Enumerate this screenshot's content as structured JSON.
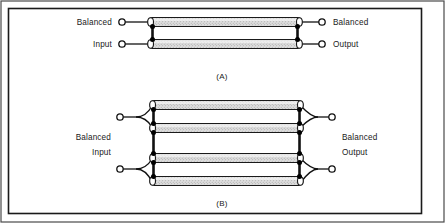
{
  "figure": {
    "background_color": "#ffffff",
    "line_color": "#111111",
    "cable_fill_color": "#d8d8d8",
    "cable_edge_color": "#1a1a1a",
    "terminal_color": "#ffffff",
    "node_color": "#000000",
    "border": {
      "outer_color": "#2b2b2b",
      "inner_color": "#1a1a1a"
    },
    "panels": [
      {
        "id": "A",
        "caption": "(A)",
        "cable_count": 2,
        "input_label_line1": "Balanced",
        "input_label_line2": "Input",
        "output_label_line1": "Balanced",
        "output_label_line2": "Output",
        "junction_style": "direct",
        "cables": [
          {
            "y": 22,
            "x1": 148,
            "x2": 302
          },
          {
            "y": 44,
            "x1": 148,
            "x2": 302
          }
        ],
        "input_terminals": [
          {
            "x": 122,
            "y": 22
          },
          {
            "x": 122,
            "y": 44
          }
        ],
        "output_terminals": [
          {
            "x": 322,
            "y": 22
          },
          {
            "x": 322,
            "y": 44
          }
        ]
      },
      {
        "id": "B",
        "caption": "(B)",
        "cable_count": 4,
        "input_label_line1": "Balanced",
        "input_label_line2": "Input",
        "output_label_line1": "Balanced",
        "output_label_line2": "Output",
        "junction_style": "fan",
        "cables": [
          {
            "y": 105,
            "x1": 150,
            "x2": 303
          },
          {
            "y": 128,
            "x1": 150,
            "x2": 303
          },
          {
            "y": 158,
            "x1": 150,
            "x2": 303
          },
          {
            "y": 181,
            "x1": 150,
            "x2": 303
          }
        ],
        "input_terminals": [
          {
            "x": 120,
            "y": 117
          },
          {
            "x": 120,
            "y": 169
          }
        ],
        "output_terminals": [
          {
            "x": 332,
            "y": 117
          },
          {
            "x": 332,
            "y": 169
          }
        ]
      }
    ],
    "geometry": {
      "cable_height": 9,
      "terminal_radius": 3.2,
      "node_radius": 2.4,
      "cable_cap_radius": 4.5
    }
  }
}
